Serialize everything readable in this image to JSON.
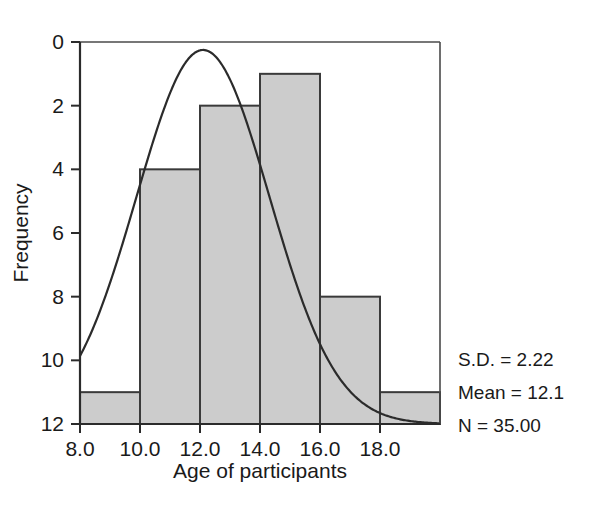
{
  "chart_data": {
    "type": "bar",
    "title": "",
    "subtitle": "",
    "xlabel": "Age of participants",
    "ylabel": "Frequency",
    "xlim": [
      8.0,
      20.0
    ],
    "ylim": [
      0,
      12
    ],
    "bin_width": 2.0,
    "categories": [
      "8.0-10.0",
      "10.0-12.0",
      "12.0-14.0",
      "14.0-16.0",
      "16.0-18.0",
      "18.0-20.0"
    ],
    "bin_edges": [
      8.0,
      10.0,
      12.0,
      14.0,
      16.0,
      18.0,
      20.0
    ],
    "values": [
      1,
      8,
      10,
      11,
      4,
      1
    ],
    "xticks": [
      "8.0",
      "10.0",
      "12.0",
      "14.0",
      "16.0",
      "18.0"
    ],
    "xtick_values": [
      8.0,
      10.0,
      12.0,
      14.0,
      16.0,
      18.0
    ],
    "yticks": [
      "0",
      "2",
      "4",
      "6",
      "8",
      "10",
      "12"
    ],
    "ytick_values": [
      0,
      2,
      4,
      6,
      8,
      10,
      12
    ],
    "grid": false,
    "legend": false,
    "bar_fill_color": "#cccccc",
    "bar_edge_color": "#3a3a3a",
    "curve_color": "#2b2b2b",
    "overlay": {
      "type": "normal-curve",
      "mean": 12.1,
      "sd": 2.22,
      "n": 35.0,
      "peak_frequency": 11.75
    },
    "annotations": [
      "S.D. = 2.22",
      "Mean = 12.1",
      "N = 35.00"
    ]
  },
  "stats": {
    "sd": "S.D. = 2.22",
    "mean": "Mean = 12.1",
    "n": "N = 35.00"
  },
  "axes": {
    "x_title": "Age of participants",
    "y_title": "Frequency",
    "x_ticks": [
      "8.0",
      "10.0",
      "12.0",
      "14.0",
      "16.0",
      "18.0"
    ],
    "y_ticks": [
      "12",
      "10",
      "8",
      "6",
      "4",
      "2",
      "0"
    ]
  }
}
